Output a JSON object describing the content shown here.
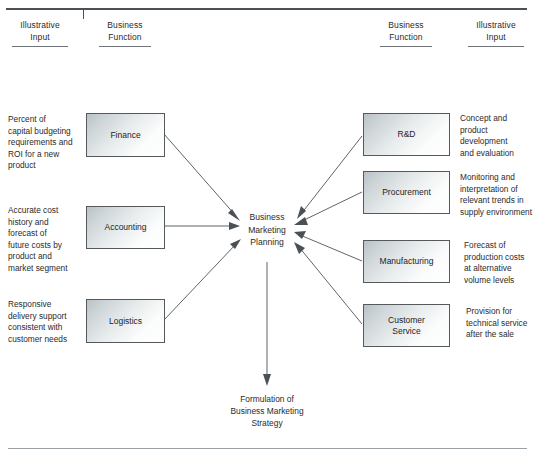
{
  "figure": {
    "type": "flow-diagram",
    "title_rules": {
      "top_rule": true,
      "bottom_rule": true
    }
  },
  "headers": [
    {
      "line1": "Illustrative",
      "line2": "Input"
    },
    {
      "line1": "Business",
      "line2": "Function"
    },
    {
      "line1": "Business",
      "line2": "Function"
    },
    {
      "line1": "Illustrative",
      "line2": "Input"
    }
  ],
  "left_inputs": [
    {
      "lines": [
        "Percent of",
        "capital budgeting",
        "requirements and",
        "ROI for a new",
        "product"
      ]
    },
    {
      "lines": [
        "Accurate cost",
        "history and",
        "forecast of",
        "future costs by",
        "product and",
        "market segment"
      ]
    },
    {
      "lines": [
        "Responsive",
        "delivery support",
        "consistent with",
        "customer needs"
      ]
    }
  ],
  "left_functions": [
    {
      "label": "Finance"
    },
    {
      "label": "Accounting"
    },
    {
      "label": "Logistics"
    }
  ],
  "right_functions": [
    {
      "label": "R&D"
    },
    {
      "label": "Procurement"
    },
    {
      "label": "Manufacturing"
    },
    {
      "label_line1": "Customer",
      "label_line2": "Service"
    }
  ],
  "right_inputs": [
    {
      "lines": [
        "Concept and product",
        "development",
        "and evaluation"
      ]
    },
    {
      "lines": [
        "Monitoring and",
        "interpretation of",
        "relevant trends in",
        "supply environment"
      ]
    },
    {
      "lines": [
        "Forecast of",
        "production costs",
        "at alternative",
        "volume levels"
      ]
    },
    {
      "lines": [
        "Provision for",
        "technical service",
        "after the sale"
      ]
    }
  ],
  "center": {
    "line1": "Business",
    "line2": "Marketing",
    "line3": "Planning"
  },
  "output": {
    "line1": "Formulation of",
    "line2": "Business Marketing",
    "line3": "Strategy"
  },
  "colors": {
    "rule": "#4a5156",
    "rule_thin": "#9aa0a4",
    "box_border": "#55595c",
    "box_fill_dark": "#b9c2c6",
    "box_fill_light": "#ffffff",
    "arrow": "#5f6569",
    "text": "#2b2b2b"
  }
}
